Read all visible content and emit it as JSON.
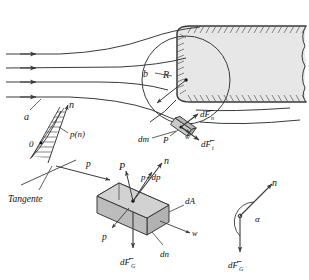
{
  "figure": {
    "colors": {
      "line": "#3a3a3a",
      "body_fill": "#e7e7e7",
      "element_fill": "#c9c9c9",
      "element_fill_dark": "#b0b0b0",
      "hatch": "#555555",
      "text": "#111111"
    }
  },
  "labels": {
    "a": "a",
    "b": "b",
    "R": "R",
    "n_top": "n",
    "p_of_n": "p(n)",
    "zero": "0",
    "tangente": "Tangente",
    "p_left": "p",
    "P_upper": "P",
    "n_box": "n",
    "p_plus_dp": "p+dp",
    "dA": "dA",
    "w_box": "w",
    "dn": "dn",
    "p_lower": "p",
    "dFG_box": "dF",
    "dFG_box_sub": "G",
    "dm": "dm",
    "P_contact": "P",
    "w_contact": "w",
    "dFn": "dF",
    "dFn_sub": "n",
    "dFt": "dF",
    "dFt_sub": "t",
    "alpha": "α",
    "n_angle": "n",
    "dFG_angle": "dF",
    "dFG_angle_sub": "G"
  }
}
